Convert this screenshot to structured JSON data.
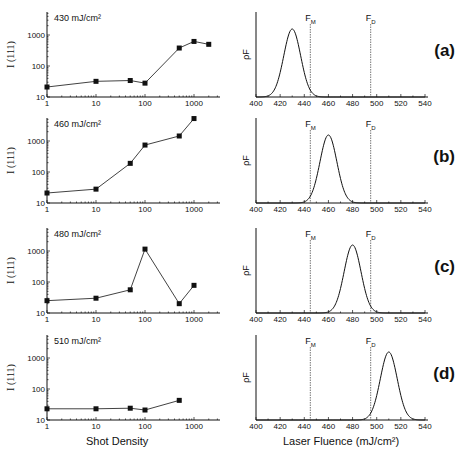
{
  "figure": {
    "left_xlabel": "Shot Density",
    "right_xlabel": "Laser Fluence (mJ/cm²)",
    "left_ylabel": "I (111)",
    "right_ylabel": "ρF",
    "threshold_labels": {
      "FM": "F",
      "FM_sub": "M",
      "FD": "F",
      "FD_sub": "D"
    }
  },
  "chart_data": [
    {
      "type": "line",
      "panel": "(a)",
      "annotation": "430 mJ/cm²",
      "xlabel": "Shot Density",
      "ylabel": "I (111)",
      "xscale": "log",
      "yscale": "log",
      "xlim": [
        1,
        3000
      ],
      "ylim": [
        10,
        5000
      ],
      "xticks": [
        "1",
        "10",
        "100",
        "1000"
      ],
      "yticks": [
        "10",
        "100",
        "1000"
      ],
      "x": [
        1,
        10,
        50,
        100,
        500,
        1000,
        2000
      ],
      "y": [
        21,
        32,
        34,
        28,
        380,
        620,
        500
      ]
    },
    {
      "type": "line",
      "panel": "(a)",
      "xlabel": "Laser Fluence (mJ/cm²)",
      "ylabel": "ρF",
      "xlim": [
        400,
        540
      ],
      "xticks": [
        "400",
        "420",
        "440",
        "460",
        "480",
        "500",
        "520",
        "540"
      ],
      "gaussian": {
        "center": 430,
        "sigma": 7,
        "peak": 0.8
      },
      "vlines": {
        "FM": 445,
        "FD": 495
      }
    },
    {
      "type": "line",
      "panel": "(b)",
      "annotation": "460 mJ/cm²",
      "xscale": "log",
      "yscale": "log",
      "xlim": [
        1,
        3000
      ],
      "ylim": [
        10,
        5000
      ],
      "xticks": [
        "1",
        "10",
        "100",
        "1000"
      ],
      "yticks": [
        "10",
        "100",
        "1000"
      ],
      "x": [
        1,
        10,
        50,
        100,
        500,
        1000
      ],
      "y": [
        21,
        28,
        190,
        740,
        1450,
        5300
      ]
    },
    {
      "type": "line",
      "panel": "(b)",
      "xlim": [
        400,
        540
      ],
      "xticks": [
        "400",
        "420",
        "440",
        "460",
        "480",
        "500",
        "520",
        "540"
      ],
      "gaussian": {
        "center": 460,
        "sigma": 7,
        "peak": 0.8
      },
      "vlines": {
        "FM": 445,
        "FD": 495
      }
    },
    {
      "type": "line",
      "panel": "(c)",
      "annotation": "480 mJ/cm²",
      "xscale": "log",
      "yscale": "log",
      "xlim": [
        1,
        3000
      ],
      "ylim": [
        10,
        5000
      ],
      "xticks": [
        "1",
        "10",
        "100",
        "1000"
      ],
      "yticks": [
        "10",
        "100",
        "1000"
      ],
      "x": [
        1,
        10,
        50,
        100,
        500,
        1000
      ],
      "y": [
        25,
        30,
        56,
        1150,
        20,
        78
      ]
    },
    {
      "type": "line",
      "panel": "(c)",
      "xlim": [
        400,
        540
      ],
      "xticks": [
        "400",
        "420",
        "440",
        "460",
        "480",
        "500",
        "520",
        "540"
      ],
      "gaussian": {
        "center": 480,
        "sigma": 7,
        "peak": 0.8
      },
      "vlines": {
        "FM": 445,
        "FD": 495
      }
    },
    {
      "type": "line",
      "panel": "(d)",
      "annotation": "510 mJ/cm²",
      "xscale": "log",
      "yscale": "log",
      "xlim": [
        1,
        3000
      ],
      "ylim": [
        10,
        5000
      ],
      "xticks": [
        "1",
        "10",
        "100",
        "1000"
      ],
      "yticks": [
        "10",
        "100",
        "1000"
      ],
      "x": [
        1,
        10,
        50,
        100,
        500
      ],
      "y": [
        23,
        23,
        24,
        21,
        43
      ]
    },
    {
      "type": "line",
      "panel": "(d)",
      "xlim": [
        400,
        540
      ],
      "xticks": [
        "400",
        "420",
        "440",
        "460",
        "480",
        "500",
        "520",
        "540"
      ],
      "gaussian": {
        "center": 510,
        "sigma": 7,
        "peak": 0.8
      },
      "vlines": {
        "FM": 445,
        "FD": 495
      }
    }
  ]
}
